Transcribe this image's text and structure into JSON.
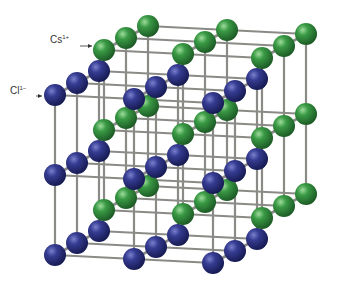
{
  "diagram": {
    "type": "crystal-lattice",
    "projection": "oblique",
    "background": "#ffffff",
    "rod_color": "#8a8a86",
    "labels": [
      {
        "id": "cs",
        "symbol": "Cs",
        "charge": "1+",
        "x": 50,
        "y": 40,
        "arrow_to": [
          92,
          46
        ]
      },
      {
        "id": "cl",
        "symbol": "Cl",
        "charge": "1−",
        "x": 10,
        "y": 90,
        "arrow_to": [
          42,
          96
        ]
      }
    ],
    "ions": [
      {
        "name": "Cl",
        "charge": "1-",
        "color": "#2b2f7a",
        "highlight": "#6a70c0",
        "origin": [
          55,
          95
        ],
        "step_x": [
          79,
          4
        ],
        "step_depth": [
          22,
          -12
        ],
        "step_y": [
          0,
          80
        ],
        "counts": [
          3,
          3,
          3
        ],
        "radius": 11
      },
      {
        "name": "Cs",
        "charge": "1+",
        "color": "#2f8a3a",
        "highlight": "#8fd490",
        "origin": [
          104,
          50
        ],
        "step_x": [
          79,
          4
        ],
        "step_depth": [
          22,
          -12
        ],
        "step_y": [
          0,
          80
        ],
        "counts": [
          3,
          3,
          3
        ],
        "radius": 11
      }
    ]
  }
}
